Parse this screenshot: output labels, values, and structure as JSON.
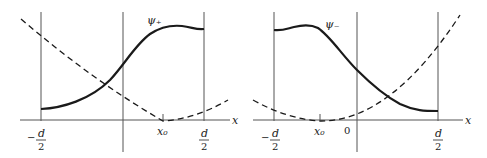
{
  "panels": [
    {
      "name": "psi-plus",
      "curve_label": "ψ₊",
      "x_axis_label": "x",
      "ticks": {
        "left_wall_sign": "−",
        "left_wall_num": "d",
        "left_wall_den": "2",
        "x0": "x₀",
        "right_wall_num": "d",
        "right_wall_den": "2"
      }
    },
    {
      "name": "psi-minus",
      "curve_label": "ψ₋",
      "x_axis_label": "x",
      "ticks": {
        "left_wall_sign": "−",
        "left_wall_num": "d",
        "left_wall_den": "2",
        "x0": "x₀",
        "origin": "0",
        "right_wall_num": "d",
        "right_wall_den": "2"
      }
    }
  ],
  "legend": {
    "solid_line": "wavefunction",
    "dashed_line": "potential (parabola centered at x₀)"
  },
  "colors": {
    "stroke": "#1a1a1a",
    "axis": "#555555"
  }
}
